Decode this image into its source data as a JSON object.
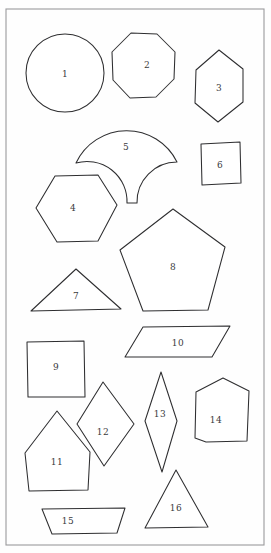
{
  "page": {
    "background_color": "#fefefe",
    "ink_color": "#2e2e30",
    "frame_color": "#9a9a9c",
    "width": 271,
    "height": 553
  },
  "frame": {
    "x": 6,
    "y": 9,
    "width": 258,
    "height": 536
  },
  "shapes": [
    {
      "id": 1,
      "label": "1",
      "kind": "circle",
      "name": "circle",
      "label_x": 65,
      "label_y": 74,
      "geometry": {
        "cx": 65,
        "cy": 73,
        "r": 39
      }
    },
    {
      "id": 2,
      "label": "2",
      "kind": "octagon",
      "name": "octagon",
      "label_x": 147,
      "label_y": 65,
      "points": "131,33 157,34 175,52 174,79 156,97 130,98 113,80 112,52"
    },
    {
      "id": 3,
      "label": "3",
      "kind": "hexagon-vertical",
      "name": "elongated-hexagon-upright",
      "label_x": 219,
      "label_y": 88,
      "points": "219,50 243,69 243,102 218,122 195,103 196,70"
    },
    {
      "id": 4,
      "label": "4",
      "kind": "hexagon",
      "name": "regular-hexagon",
      "label_x": 73,
      "label_y": 208,
      "points": "55,176 98,175 117,205 98,241 57,242 36,208"
    },
    {
      "id": 5,
      "label": "5",
      "kind": "fan",
      "name": "fan-shell",
      "label_x": 126,
      "label_y": 147,
      "path": "M 76,163 A 56,56 0 0 1 177,162 L 177,162 A 40,40 0 0 0 137,203 L 127,203 A 40,40 0 0 0 76,163 Z"
    },
    {
      "id": 6,
      "label": "6",
      "kind": "rectangle",
      "name": "rectangle-portrait",
      "label_x": 220,
      "label_y": 165,
      "points": "201,144 240,142 241,183 202,185"
    },
    {
      "id": 7,
      "label": "7",
      "kind": "triangle",
      "name": "obtuse-triangle",
      "label_x": 76,
      "label_y": 296,
      "points": "76,269 121,309 31,311"
    },
    {
      "id": 8,
      "label": "8",
      "kind": "pentagon",
      "name": "pentagon",
      "label_x": 173,
      "label_y": 267,
      "points": "173,209 225,247 208,310 143,311 120,250"
    },
    {
      "id": 9,
      "label": "9",
      "kind": "square",
      "name": "square",
      "label_x": 56,
      "label_y": 367,
      "points": "27,342 84,341 85,397 28,397"
    },
    {
      "id": 10,
      "label": "10",
      "kind": "parallelogram",
      "name": "parallelogram",
      "label_x": 178,
      "label_y": 343,
      "points": "143,327 230,326 212,357 125,357"
    },
    {
      "id": 11,
      "label": "11",
      "kind": "hexagon",
      "name": "pointed-hexagon",
      "label_x": 57,
      "label_y": 462,
      "points": "57,411 90,452 88,490 29,491 25,453"
    },
    {
      "id": 12,
      "label": "12",
      "kind": "rhombus",
      "name": "rhombus-wide",
      "label_x": 103,
      "label_y": 432,
      "points": "103,382 134,424 104,466 77,424"
    },
    {
      "id": 13,
      "label": "13",
      "kind": "rhombus",
      "name": "rhombus-narrow",
      "label_x": 160,
      "label_y": 414,
      "points": "161,372 177,421 162,472 145,421"
    },
    {
      "id": 14,
      "label": "14",
      "kind": "hexagon",
      "name": "elongated-hexagon-tall",
      "label_x": 216,
      "label_y": 420,
      "points": "196,392 223,378 249,391 247,441 206,442 195,438"
    },
    {
      "id": 15,
      "label": "15",
      "kind": "trapezoid",
      "name": "trapezoid",
      "label_x": 68,
      "label_y": 521,
      "points": "42,509 125,508 117,533 52,534"
    },
    {
      "id": 16,
      "label": "16",
      "kind": "triangle",
      "name": "isosceles-triangle",
      "label_x": 176,
      "label_y": 508,
      "points": "176,470 208,527 145,528"
    }
  ]
}
